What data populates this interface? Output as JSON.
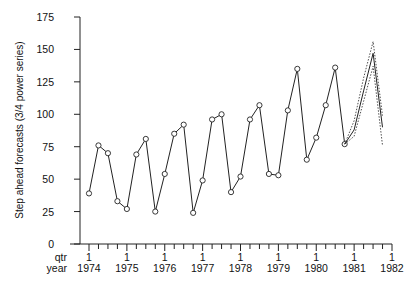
{
  "chart_data": {
    "type": "line",
    "title": "",
    "ylabel": "Step ahead forecasts (3/4 power series)",
    "xlabel_rows": [
      "qtr",
      "year"
    ],
    "ylim": [
      0,
      175
    ],
    "yticks": [
      0,
      25,
      50,
      75,
      100,
      125,
      150,
      175
    ],
    "xticks": [
      {
        "qtr": "1",
        "year": "1974"
      },
      {
        "qtr": "1",
        "year": "1975"
      },
      {
        "qtr": "1",
        "year": "1976"
      },
      {
        "qtr": "1",
        "year": "1977"
      },
      {
        "qtr": "1",
        "year": "1978"
      },
      {
        "qtr": "1",
        "year": "1979"
      },
      {
        "qtr": "1",
        "year": "1980"
      },
      {
        "qtr": "1",
        "year": "1981"
      },
      {
        "qtr": "1",
        "year": "1982"
      }
    ],
    "xrange": [
      1974.0,
      1982.0
    ],
    "grid": false,
    "legend": null,
    "series": [
      {
        "name": "observed",
        "style": "solid-with-circle-markers",
        "x": [
          1974.0,
          1974.25,
          1974.5,
          1974.75,
          1975.0,
          1975.25,
          1975.5,
          1975.75,
          1976.0,
          1976.25,
          1976.5,
          1976.75,
          1977.0,
          1977.25,
          1977.5,
          1977.75,
          1978.0,
          1978.25,
          1978.5,
          1978.75,
          1979.0,
          1979.25,
          1979.5,
          1979.75,
          1980.0,
          1980.25,
          1980.5,
          1980.75
        ],
        "values": [
          39,
          76,
          70,
          33,
          27,
          69,
          81,
          25,
          54,
          85,
          92,
          24,
          49,
          96,
          100,
          40,
          52,
          96,
          107,
          54,
          53,
          103,
          135,
          65,
          82,
          107,
          136,
          77
        ]
      },
      {
        "name": "forecast",
        "style": "solid",
        "x": [
          1980.75,
          1981.0,
          1981.25,
          1981.5,
          1981.75
        ],
        "values": [
          77,
          88,
          118,
          147,
          90
        ]
      },
      {
        "name": "forecast-upper",
        "style": "dotted",
        "x": [
          1980.75,
          1981.0,
          1981.25,
          1981.5,
          1981.75
        ],
        "values": [
          77,
          95,
          128,
          156,
          99
        ]
      },
      {
        "name": "forecast-lower",
        "style": "dotted",
        "x": [
          1980.75,
          1981.0,
          1981.25,
          1981.5,
          1981.75
        ],
        "values": [
          77,
          83,
          110,
          137,
          76
        ]
      }
    ]
  },
  "plot_area": {
    "x0": 89,
    "x1": 392,
    "y0": 244,
    "y1": 17,
    "yaxis_x": 80
  }
}
